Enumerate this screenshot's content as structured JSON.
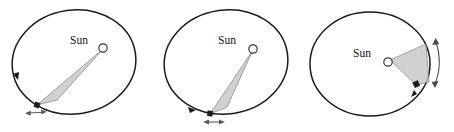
{
  "figure": {
    "background_color": "#ffffff",
    "width": 454,
    "height": 132,
    "panel_count": 3
  },
  "style": {
    "orbit_stroke": "#1b1b1b",
    "sector_fill": "#c9c9c9",
    "sector_stroke": "#6e6e6e",
    "sun_fill": "#ffffff",
    "sun_stroke": "#3a3a3a",
    "planet_dot": "#1b1b1b",
    "velocity_arrow": "#5c5c5c",
    "sweep_arrow": "#4a4a4a"
  },
  "panels": [
    {
      "id": "panel-a",
      "name": "orbit-panel-left",
      "sun_label": "Sun",
      "sun_label_x": 70,
      "sun_label_y": 44,
      "sun_x": 103,
      "sun_y": 48,
      "sun_radius": 4.2,
      "ellipse": {
        "cx": 74,
        "cy": 62,
        "rx": 62,
        "ry": 52,
        "rotation": -8
      },
      "planet_dot": {
        "x": 37,
        "y": 105
      },
      "sector_points": "103,49 37,105 57,100",
      "orbit_arrow_angle_deg": 196,
      "velocity_arrow": {
        "x1": 26,
        "y1": 113,
        "x2": 46,
        "y2": 112,
        "direction": "double"
      },
      "sweep_arrow": {
        "present": false
      }
    },
    {
      "id": "panel-b",
      "name": "orbit-panel-middle",
      "sun_label": "Sun",
      "sun_label_x": 66,
      "sun_label_y": 44,
      "sun_x": 101,
      "sun_y": 49,
      "sun_radius": 4.2,
      "ellipse": {
        "cx": 74,
        "cy": 62,
        "rx": 62,
        "ry": 52,
        "rotation": -8
      },
      "planet_dot": {
        "x": 58,
        "y": 114
      },
      "sector_points": "101,50 58,114 75,108",
      "orbit_arrow_angle_deg": 206,
      "velocity_arrow": {
        "x1": 52,
        "y1": 122,
        "x2": 72,
        "y2": 122,
        "direction": "double"
      },
      "sweep_arrow": {
        "present": false
      }
    },
    {
      "id": "panel-c",
      "name": "orbit-panel-right",
      "sun_label": "Sun",
      "sun_label_x": 49,
      "sun_label_y": 57,
      "sun_x": 84,
      "sun_y": 62,
      "sun_radius": 4.2,
      "ellipse": {
        "cx": 66,
        "cy": 64,
        "rx": 60,
        "ry": 52,
        "rotation": 0
      },
      "planet_dot": {
        "x": 114,
        "y": 86
      },
      "sector_points": "86,60 124,46 126,82 114,86",
      "orbit_arrow_angle_deg": 38,
      "velocity_arrow": {
        "present": false
      },
      "sweep_arrow": {
        "present": true,
        "cx": 66,
        "cy": 64,
        "radius": 68,
        "start_deg": -38,
        "end_deg": 28,
        "direction": "double"
      }
    }
  ],
  "annotations": {
    "sun_marker_name": "sun-marker",
    "planet_marker_name": "planet-marker",
    "swept_area_name": "swept-area-sector",
    "orbit_name": "elliptical-orbit-path"
  }
}
